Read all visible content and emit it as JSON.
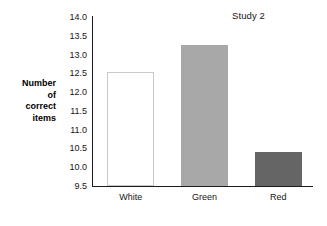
{
  "chart_data": {
    "type": "bar",
    "title": "",
    "annotation": "Study 2",
    "categories": [
      "White",
      "Green",
      "Red"
    ],
    "values": [
      12.53,
      13.25,
      10.4
    ],
    "series": [
      {
        "name": "Number of correct items",
        "values": [
          12.53,
          13.25,
          10.4
        ]
      }
    ],
    "xlabel": "",
    "ylabel": "Number of correct items",
    "ylabel_lines": [
      "Number",
      "of",
      "correct",
      "items"
    ],
    "ylim": [
      9.5,
      14.0
    ],
    "yticks": [
      9.5,
      10.0,
      10.5,
      11.0,
      11.5,
      12.0,
      12.5,
      13.0,
      13.5,
      14.0
    ],
    "ytick_labels": [
      "9.5",
      "10.0",
      "10.5",
      "11.0",
      "11.5",
      "12.0",
      "12.5",
      "13.0",
      "13.5",
      "14.0"
    ],
    "grid": false,
    "legend": false,
    "bar_colors": [
      "#ffffff",
      "#a8a8a8",
      "#656565"
    ],
    "bar_border_colors": [
      "#c9c9c9",
      "#a8a8a8",
      "#656565"
    ],
    "axis_color": "#1a1a1a"
  }
}
